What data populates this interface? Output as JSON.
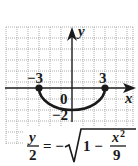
{
  "figure": {
    "type": "graph-of-equation",
    "equation": {
      "lhs_num": "y",
      "lhs_den": "2",
      "equals": "= −",
      "radicand_lead": "1 −",
      "frac_num": "x",
      "frac_num_exp": "2",
      "frac_den": "9"
    },
    "axes": {
      "x_label": "x",
      "y_label": "y",
      "origin_label": "0"
    },
    "tick_labels": {
      "x_left": "−3",
      "x_right": "3",
      "y_bottom": "−2"
    },
    "curve": {
      "description": "lower half of ellipse x²/9 + y²/4 = 1",
      "endpoints": [
        [
          -3,
          0
        ],
        [
          3,
          0
        ]
      ],
      "vertex": [
        0,
        -2
      ],
      "endpoint_style": "filled-dot"
    },
    "grid": {
      "x_range": [
        -6,
        5
      ],
      "y_range": [
        -5,
        5
      ],
      "unit_px": 11,
      "style": "dotted"
    },
    "colors": {
      "curve": "#1a1a1a",
      "axes": "#1a1a1a",
      "grid": "#9a9a9a"
    }
  }
}
